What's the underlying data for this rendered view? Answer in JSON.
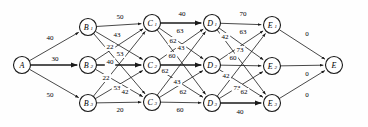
{
  "diagram": {
    "node_radius": 8.5,
    "colors": {
      "stroke": "#1a1a1a",
      "node_fill": "#ffffff",
      "background": "#fefefe"
    },
    "nodes": [
      {
        "id": "A",
        "label": "A",
        "sub": "",
        "x": 22,
        "y": 65
      },
      {
        "id": "B1",
        "label": "B",
        "sub": "1",
        "x": 88,
        "y": 27
      },
      {
        "id": "B2",
        "label": "B",
        "sub": "2",
        "x": 88,
        "y": 65
      },
      {
        "id": "B3",
        "label": "B",
        "sub": "3",
        "x": 88,
        "y": 103
      },
      {
        "id": "C1",
        "label": "C",
        "sub": "1",
        "x": 152,
        "y": 23
      },
      {
        "id": "C2",
        "label": "C",
        "sub": "2",
        "x": 152,
        "y": 65
      },
      {
        "id": "C3",
        "label": "C",
        "sub": "3",
        "x": 152,
        "y": 102
      },
      {
        "id": "D1",
        "label": "D",
        "sub": "1",
        "x": 212,
        "y": 23
      },
      {
        "id": "D2",
        "label": "D",
        "sub": "2",
        "x": 212,
        "y": 65
      },
      {
        "id": "D3",
        "label": "D",
        "sub": "3",
        "x": 212,
        "y": 103
      },
      {
        "id": "E1",
        "label": "E",
        "sub": "1",
        "x": 272,
        "y": 25
      },
      {
        "id": "E2",
        "label": "E",
        "sub": "2",
        "x": 272,
        "y": 66
      },
      {
        "id": "E3",
        "label": "E",
        "sub": "3",
        "x": 272,
        "y": 103
      },
      {
        "id": "E",
        "label": "E",
        "sub": "",
        "x": 334,
        "y": 65
      }
    ],
    "edges": [
      {
        "from": "A",
        "to": "B1",
        "weight": "40",
        "lx": 50,
        "ly": 38
      },
      {
        "from": "A",
        "to": "B2",
        "weight": "30",
        "lx": 55,
        "ly": 59
      },
      {
        "from": "A",
        "to": "B3",
        "weight": "50",
        "lx": 50,
        "ly": 95
      },
      {
        "from": "B1",
        "to": "C1",
        "weight": "50",
        "lx": 120,
        "ly": 17
      },
      {
        "from": "B1",
        "to": "C2",
        "weight": "43",
        "lx": 117,
        "ly": 35
      },
      {
        "from": "B1",
        "to": "C3",
        "weight": "22",
        "lx": 110,
        "ly": 47
      },
      {
        "from": "B2",
        "to": "C1",
        "weight": "53",
        "lx": 120,
        "ly": 54
      },
      {
        "from": "B2",
        "to": "C2",
        "weight": "40",
        "lx": 110,
        "ly": 62
      },
      {
        "from": "B2",
        "to": "C3",
        "weight": "22",
        "lx": 106,
        "ly": 78
      },
      {
        "from": "B3",
        "to": "C1",
        "weight": "53",
        "lx": 117,
        "ly": 88
      },
      {
        "from": "B3",
        "to": "C2",
        "weight": "42",
        "lx": 125,
        "ly": 92
      },
      {
        "from": "B3",
        "to": "C3",
        "weight": "20",
        "lx": 120,
        "ly": 110
      },
      {
        "from": "C1",
        "to": "D1",
        "weight": "40",
        "lx": 182,
        "ly": 14
      },
      {
        "from": "C1",
        "to": "D2",
        "weight": "63",
        "lx": 180,
        "ly": 31
      },
      {
        "from": "C1",
        "to": "D3",
        "weight": "62",
        "lx": 173,
        "ly": 41
      },
      {
        "from": "C2",
        "to": "D1",
        "weight": "43",
        "lx": 181,
        "ly": 48
      },
      {
        "from": "C2",
        "to": "D2",
        "weight": "60",
        "lx": 172,
        "ly": 56
      },
      {
        "from": "C2",
        "to": "D3",
        "weight": "62",
        "lx": 165,
        "ly": 71
      },
      {
        "from": "C3",
        "to": "D1",
        "weight": "43",
        "lx": 177,
        "ly": 82
      },
      {
        "from": "C3",
        "to": "D2",
        "weight": "62",
        "lx": 183,
        "ly": 92
      },
      {
        "from": "C3",
        "to": "D3",
        "weight": "60",
        "lx": 180,
        "ly": 110
      },
      {
        "from": "D1",
        "to": "E1",
        "weight": "70",
        "lx": 243,
        "ly": 14
      },
      {
        "from": "D1",
        "to": "E2",
        "weight": "63",
        "lx": 243,
        "ly": 32
      },
      {
        "from": "D1",
        "to": "E3",
        "weight": "42",
        "lx": 225,
        "ly": 37
      },
      {
        "from": "D2",
        "to": "E1",
        "weight": "73",
        "lx": 240,
        "ly": 50
      },
      {
        "from": "D2",
        "to": "E2",
        "weight": "60",
        "lx": 233,
        "ly": 58
      },
      {
        "from": "D2",
        "to": "E3",
        "weight": "42",
        "lx": 226,
        "ly": 76
      },
      {
        "from": "D3",
        "to": "E1",
        "weight": "73",
        "lx": 237,
        "ly": 88
      },
      {
        "from": "D3",
        "to": "E2",
        "weight": "62",
        "lx": 244,
        "ly": 92
      },
      {
        "from": "D3",
        "to": "E3",
        "weight": "40",
        "lx": 240,
        "ly": 112
      },
      {
        "from": "E1",
        "to": "E",
        "weight": "0",
        "lx": 307,
        "ly": 34
      },
      {
        "from": "E2",
        "to": "E",
        "weight": "0",
        "lx": 307,
        "ly": 74
      },
      {
        "from": "E3",
        "to": "E",
        "weight": "0",
        "lx": 307,
        "ly": 95
      }
    ]
  }
}
